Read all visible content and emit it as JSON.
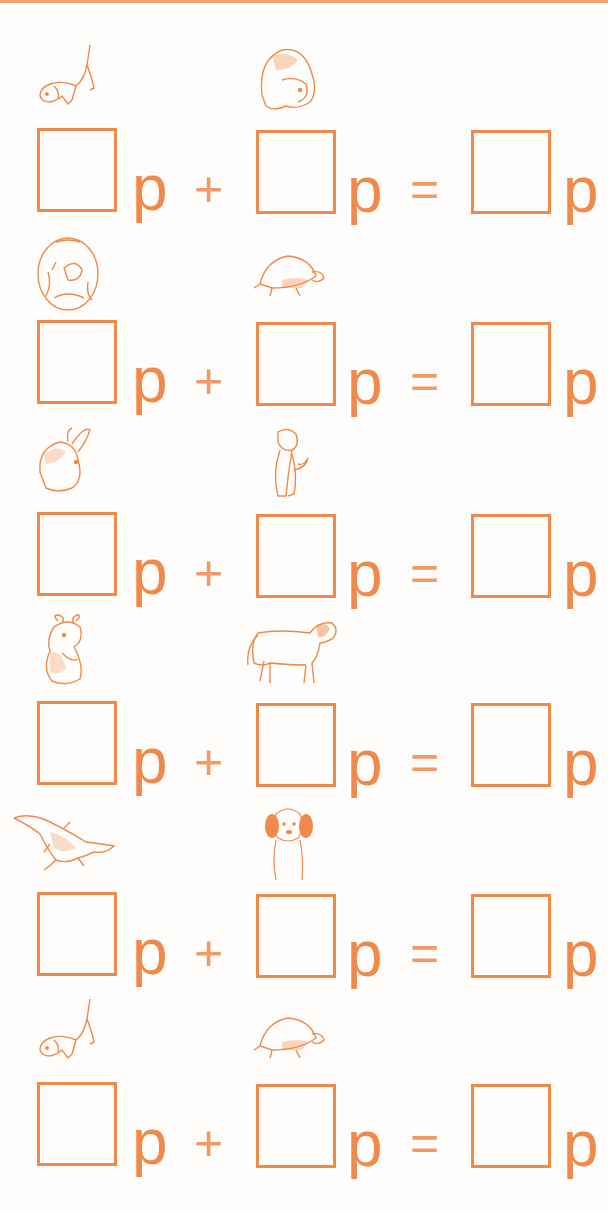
{
  "worksheet": {
    "accent_color": "#f08a4b",
    "rows": [
      {
        "left_pet": "dog",
        "right_pet": "guinea-pig",
        "box1": "",
        "box2": "",
        "box3": "",
        "unit": "p",
        "plus": "+",
        "equals": "="
      },
      {
        "left_pet": "goldfish",
        "right_pet": "tortoise",
        "box1": "",
        "box2": "",
        "box3": "",
        "unit": "p",
        "plus": "+",
        "equals": "="
      },
      {
        "left_pet": "rabbit",
        "right_pet": "kitten",
        "box1": "",
        "box2": "",
        "box3": "",
        "unit": "p",
        "plus": "+",
        "equals": "="
      },
      {
        "left_pet": "hamster",
        "right_pet": "pony",
        "box1": "",
        "box2": "",
        "box3": "",
        "unit": "p",
        "plus": "+",
        "equals": "="
      },
      {
        "left_pet": "crocodile",
        "right_pet": "puppy",
        "box1": "",
        "box2": "",
        "box3": "",
        "unit": "p",
        "plus": "+",
        "equals": "="
      },
      {
        "left_pet": "dog",
        "right_pet": "tortoise",
        "box1": "",
        "box2": "",
        "box3": "",
        "unit": "p",
        "plus": "+",
        "equals": "="
      }
    ]
  }
}
